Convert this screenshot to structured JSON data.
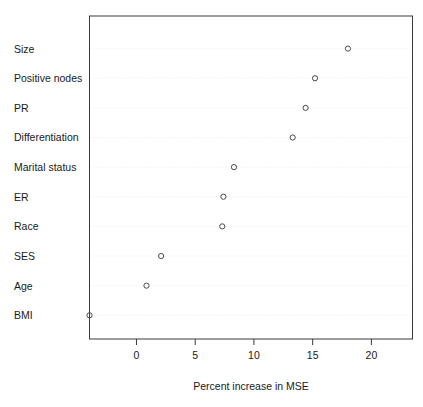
{
  "chart_data": {
    "type": "scatter",
    "title": "",
    "subtitle": "",
    "xlabel": "Percent increase in MSE",
    "ylabel": "",
    "orientation": "horizontal",
    "grid": "horizontal-dotted",
    "legend": "none",
    "marker": "open-circle",
    "xlim": [
      -4.0,
      23.5
    ],
    "xticks": [
      0,
      5,
      10,
      15,
      20
    ],
    "xtick_labels": [
      "0",
      "5",
      "10",
      "15",
      "20"
    ],
    "categories": [
      "Size",
      "Positive nodes",
      "PR",
      "Differentiation",
      "Marital status",
      "ER",
      "Race",
      "SES",
      "Age",
      "BMI"
    ],
    "values": [
      18.0,
      15.2,
      14.4,
      13.3,
      8.3,
      7.4,
      7.3,
      2.1,
      0.85,
      -4.0
    ],
    "points": [
      {
        "category": "Size",
        "value": 18.0
      },
      {
        "category": "Positive nodes",
        "value": 15.2
      },
      {
        "category": "PR",
        "value": 14.4
      },
      {
        "category": "Differentiation",
        "value": 13.3
      },
      {
        "category": "Marital status",
        "value": 8.3
      },
      {
        "category": "ER",
        "value": 7.4
      },
      {
        "category": "Race",
        "value": 7.3
      },
      {
        "category": "SES",
        "value": 2.1
      },
      {
        "category": "Age",
        "value": 0.85
      },
      {
        "category": "BMI",
        "value": -4.0
      }
    ]
  },
  "colors": {
    "background": "#ffffff",
    "frame": "#3a3a3a",
    "gridline": "#e8e8e8",
    "marker": "#4a4a4a",
    "text": "#1a1a1a"
  }
}
